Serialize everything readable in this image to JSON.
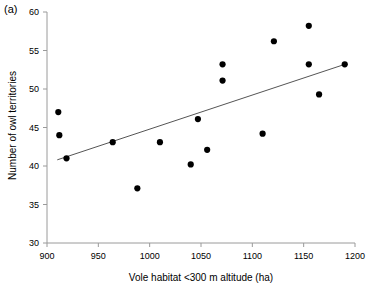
{
  "panel": {
    "label": "(a)"
  },
  "chart_data": {
    "type": "scatter",
    "title": "",
    "xlabel": "Vole habitat <300 m altitude (ha)",
    "ylabel": "Number of owl territories",
    "xlim": [
      900,
      1200
    ],
    "ylim": [
      30,
      60
    ],
    "xticks": [
      900,
      950,
      1000,
      1050,
      1100,
      1150,
      1200
    ],
    "yticks": [
      30,
      35,
      40,
      45,
      50,
      55,
      60
    ],
    "xtick_labels": [
      "900",
      "950",
      "1000",
      "1050",
      "1100",
      "1150",
      "1200"
    ],
    "ytick_labels": [
      "30",
      "35",
      "40",
      "45",
      "50",
      "55",
      "60"
    ],
    "grid": false,
    "legend": null,
    "marker": {
      "shape": "circle",
      "color": "#000000",
      "size": 5
    },
    "points": [
      {
        "x": 911,
        "y": 47.0
      },
      {
        "x": 912,
        "y": 44.0
      },
      {
        "x": 919,
        "y": 41.0
      },
      {
        "x": 964,
        "y": 43.1
      },
      {
        "x": 988,
        "y": 37.1
      },
      {
        "x": 1010,
        "y": 43.1
      },
      {
        "x": 1040,
        "y": 40.2
      },
      {
        "x": 1047,
        "y": 46.1
      },
      {
        "x": 1056,
        "y": 42.1
      },
      {
        "x": 1071,
        "y": 53.2
      },
      {
        "x": 1071,
        "y": 51.1
      },
      {
        "x": 1110,
        "y": 44.2
      },
      {
        "x": 1121,
        "y": 56.2
      },
      {
        "x": 1155,
        "y": 58.2
      },
      {
        "x": 1155,
        "y": 53.2
      },
      {
        "x": 1165,
        "y": 49.3
      },
      {
        "x": 1190,
        "y": 53.2
      }
    ],
    "trendline": {
      "type": "linear-fit",
      "color": "#555555",
      "x_start": 910,
      "y_start": 40.8,
      "x_end": 1190,
      "y_end": 53.2
    }
  }
}
